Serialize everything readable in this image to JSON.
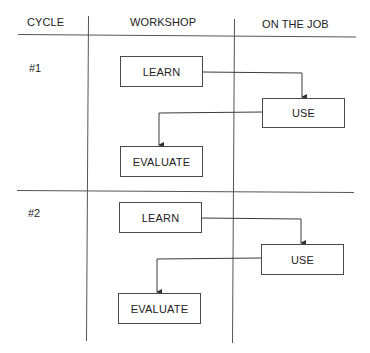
{
  "diagram": {
    "type": "swimlane-flow",
    "columns": [
      {
        "id": "cycle",
        "label": "CYCLE"
      },
      {
        "id": "workshop",
        "label": "WORKSHOP"
      },
      {
        "id": "on_the_job",
        "label": "ON THE JOB"
      }
    ],
    "cycles": [
      {
        "label": "#1",
        "steps": [
          {
            "label": "LEARN",
            "lane": "workshop"
          },
          {
            "label": "USE",
            "lane": "on_the_job"
          },
          {
            "label": "EVALUATE",
            "lane": "workshop"
          }
        ]
      },
      {
        "label": "#2",
        "steps": [
          {
            "label": "LEARN",
            "lane": "workshop"
          },
          {
            "label": "USE",
            "lane": "on_the_job"
          },
          {
            "label": "EVALUATE",
            "lane": "workshop"
          }
        ]
      }
    ],
    "edges": [
      {
        "cycle": 1,
        "from": "LEARN",
        "to": "USE"
      },
      {
        "cycle": 1,
        "from": "USE",
        "to": "EVALUATE"
      },
      {
        "cycle": 2,
        "from": "LEARN",
        "to": "USE"
      },
      {
        "cycle": 2,
        "from": "USE",
        "to": "EVALUATE"
      }
    ],
    "colors": {
      "line": "#4a4a4a",
      "text": "#222222",
      "background": "#ffffff"
    }
  }
}
